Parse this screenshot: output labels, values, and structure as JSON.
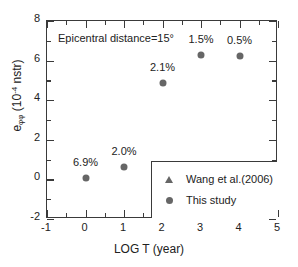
{
  "chart_data": {
    "type": "scatter",
    "title": "",
    "xlabel": "LOG T (year)",
    "ylabel": "eφφ (10⁻⁴ nstr)",
    "ylabel_base": "e",
    "ylabel_sub": "φφ",
    "ylabel_unit_pre": " (10",
    "ylabel_sup": "-4",
    "ylabel_unit_post": " nstr)",
    "xlim": [
      -1,
      5
    ],
    "ylim": [
      -2,
      8
    ],
    "xticks": [
      -1,
      0,
      1,
      2,
      3,
      4,
      5
    ],
    "xticklabels": [
      "-1",
      "0",
      "1",
      "2",
      "3",
      "4",
      "5"
    ],
    "xminor": [
      -0.5,
      0.5,
      1.5,
      2.5,
      3.5,
      4.5
    ],
    "yticks": [
      -2,
      0,
      2,
      4,
      6,
      8
    ],
    "yticklabels": [
      "-2",
      "0",
      "2",
      "4",
      "6",
      "8"
    ],
    "yminor": [
      -1,
      1,
      3,
      5,
      7
    ],
    "grid": false,
    "annotation": "Epicentral distance=15°",
    "legend_position": "lower-right",
    "series": [
      {
        "name": "Wang et al.(2006)",
        "marker": "triangle",
        "color": "#666666",
        "x": [],
        "y": []
      },
      {
        "name": "This study",
        "marker": "circle",
        "color": "#666666",
        "x": [
          0,
          1,
          2,
          3,
          4
        ],
        "y": [
          0.05,
          0.65,
          4.85,
          6.3,
          6.25
        ],
        "point_labels": [
          "6.9%",
          "2.0%",
          "2.1%",
          "1.5%",
          "0.5%"
        ]
      }
    ]
  },
  "legend": {
    "entries": [
      {
        "label": "Wang et al.(2006)",
        "marker": "triangle"
      },
      {
        "label": "This study",
        "marker": "circle"
      }
    ]
  }
}
